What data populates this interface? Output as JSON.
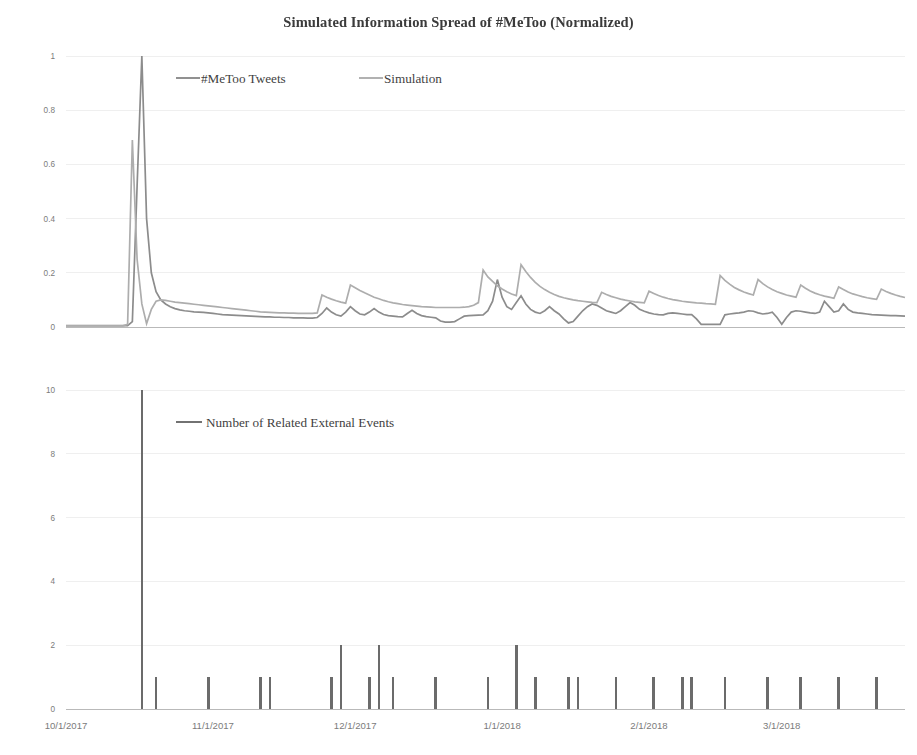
{
  "figure": {
    "title": "Simulated Information Spread of #MeToo (Normalized)",
    "ghost_header": "",
    "width": 917,
    "height": 755,
    "background": "#ffffff"
  },
  "colors": {
    "tweets": "#8c8c8c",
    "simulation": "#adadad",
    "events": "#6b6b6b",
    "grid": "#efefef",
    "axis": "#b9b9b9",
    "tick_text": "#7b7b7b",
    "title_text": "#3b3b3b",
    "legend_text": "#3f3f3f"
  },
  "chart_data": [
    {
      "type": "line",
      "title": "Simulated Information Spread of #MeToo (Normalized)",
      "panel": "top",
      "xlabel": "",
      "ylabel": "",
      "grid": true,
      "legend_position": "inside-top-left",
      "ylim": [
        0,
        1
      ],
      "yticks": [
        0,
        0.2,
        0.4,
        0.6,
        0.8,
        1
      ],
      "ytick_labels": [
        "0",
        "0.2",
        "0.4",
        "0.6",
        "0.8",
        "1"
      ],
      "xlim": [
        "10/1/2017",
        "3/26/2018"
      ],
      "xticks": [
        "10/1/2017",
        "11/1/2017",
        "12/1/2017",
        "1/1/2018",
        "2/1/2018",
        "3/1/2018"
      ],
      "x_total_days": 177,
      "x_tick_days": [
        0,
        31,
        61,
        92,
        123,
        151
      ],
      "legend": [
        {
          "name": "#MeToo Tweets",
          "color": "#8c8c8c"
        },
        {
          "name": "Simulation",
          "color": "#adadad"
        }
      ],
      "series": [
        {
          "name": "#MeToo Tweets",
          "color": "#8c8c8c",
          "x_days": [
            0,
            1,
            2,
            3,
            4,
            5,
            6,
            7,
            8,
            9,
            10,
            11,
            12,
            13,
            14,
            15,
            16,
            17,
            18,
            19,
            20,
            21,
            22,
            23,
            24,
            25,
            26,
            27,
            28,
            29,
            30,
            31,
            32,
            33,
            34,
            35,
            36,
            37,
            38,
            39,
            40,
            41,
            42,
            43,
            44,
            45,
            46,
            47,
            48,
            49,
            50,
            51,
            52,
            53,
            54,
            55,
            56,
            57,
            58,
            59,
            60,
            61,
            62,
            63,
            64,
            65,
            66,
            67,
            68,
            69,
            70,
            71,
            72,
            73,
            74,
            75,
            76,
            77,
            78,
            79,
            80,
            81,
            82,
            83,
            84,
            85,
            86,
            87,
            88,
            89,
            90,
            91,
            92,
            93,
            94,
            95,
            96,
            97,
            98,
            99,
            100,
            101,
            102,
            103,
            104,
            105,
            106,
            107,
            108,
            109,
            110,
            111,
            112,
            113,
            114,
            115,
            116,
            117,
            118,
            119,
            120,
            121,
            122,
            123,
            124,
            125,
            126,
            127,
            128,
            129,
            130,
            131,
            132,
            133,
            134,
            135,
            136,
            137,
            138,
            139,
            140,
            141,
            142,
            143,
            144,
            145,
            146,
            147,
            148,
            149,
            150,
            151,
            152,
            153,
            154,
            155,
            156,
            157,
            158,
            159,
            160,
            161,
            162,
            163,
            164,
            165,
            166,
            167,
            168,
            169,
            170,
            171,
            172,
            173,
            174,
            175,
            176,
            177
          ],
          "values": [
            0.005,
            0.005,
            0.005,
            0.005,
            0.005,
            0.005,
            0.005,
            0.005,
            0.005,
            0.005,
            0.005,
            0.005,
            0.005,
            0.005,
            0.02,
            0.52,
            1.0,
            0.4,
            0.2,
            0.13,
            0.1,
            0.085,
            0.075,
            0.068,
            0.063,
            0.06,
            0.058,
            0.056,
            0.055,
            0.054,
            0.052,
            0.05,
            0.048,
            0.046,
            0.045,
            0.044,
            0.043,
            0.042,
            0.041,
            0.04,
            0.039,
            0.038,
            0.037,
            0.037,
            0.036,
            0.036,
            0.035,
            0.035,
            0.034,
            0.034,
            0.034,
            0.033,
            0.033,
            0.035,
            0.05,
            0.07,
            0.055,
            0.045,
            0.04,
            0.055,
            0.075,
            0.06,
            0.048,
            0.045,
            0.055,
            0.068,
            0.055,
            0.046,
            0.042,
            0.04,
            0.038,
            0.037,
            0.05,
            0.062,
            0.05,
            0.042,
            0.038,
            0.036,
            0.034,
            0.022,
            0.018,
            0.018,
            0.02,
            0.03,
            0.04,
            0.042,
            0.043,
            0.044,
            0.045,
            0.06,
            0.095,
            0.175,
            0.11,
            0.075,
            0.065,
            0.09,
            0.115,
            0.085,
            0.065,
            0.055,
            0.05,
            0.06,
            0.075,
            0.06,
            0.048,
            0.03,
            0.015,
            0.02,
            0.04,
            0.06,
            0.075,
            0.085,
            0.08,
            0.07,
            0.06,
            0.055,
            0.05,
            0.06,
            0.075,
            0.09,
            0.08,
            0.065,
            0.058,
            0.052,
            0.048,
            0.046,
            0.045,
            0.05,
            0.052,
            0.05,
            0.048,
            0.046,
            0.046,
            0.03,
            0.01,
            0.01,
            0.01,
            0.01,
            0.01,
            0.045,
            0.048,
            0.05,
            0.052,
            0.055,
            0.06,
            0.058,
            0.052,
            0.048,
            0.05,
            0.055,
            0.035,
            0.01,
            0.035,
            0.055,
            0.06,
            0.058,
            0.055,
            0.052,
            0.05,
            0.055,
            0.095,
            0.075,
            0.055,
            0.06,
            0.085,
            0.065,
            0.055,
            0.052,
            0.05,
            0.048,
            0.046,
            0.045,
            0.044,
            0.043,
            0.042,
            0.042,
            0.041,
            0.04
          ]
        },
        {
          "name": "Simulation",
          "color": "#adadad",
          "x_days": [
            0,
            1,
            2,
            3,
            4,
            5,
            6,
            7,
            8,
            9,
            10,
            11,
            12,
            13,
            14,
            15,
            16,
            17,
            18,
            19,
            20,
            21,
            22,
            23,
            24,
            25,
            26,
            27,
            28,
            29,
            30,
            31,
            32,
            33,
            34,
            35,
            36,
            37,
            38,
            39,
            40,
            41,
            42,
            43,
            44,
            45,
            46,
            47,
            48,
            49,
            50,
            51,
            52,
            53,
            54,
            55,
            56,
            57,
            58,
            59,
            60,
            61,
            62,
            63,
            64,
            65,
            66,
            67,
            68,
            69,
            70,
            71,
            72,
            73,
            74,
            75,
            76,
            77,
            78,
            79,
            80,
            81,
            82,
            83,
            84,
            85,
            86,
            87,
            88,
            89,
            90,
            91,
            92,
            93,
            94,
            95,
            96,
            97,
            98,
            99,
            100,
            101,
            102,
            103,
            104,
            105,
            106,
            107,
            108,
            109,
            110,
            111,
            112,
            113,
            114,
            115,
            116,
            117,
            118,
            119,
            120,
            121,
            122,
            123,
            124,
            125,
            126,
            127,
            128,
            129,
            130,
            131,
            132,
            133,
            134,
            135,
            136,
            137,
            138,
            139,
            140,
            141,
            142,
            143,
            144,
            145,
            146,
            147,
            148,
            149,
            150,
            151,
            152,
            153,
            154,
            155,
            156,
            157,
            158,
            159,
            160,
            161,
            162,
            163,
            164,
            165,
            166,
            167,
            168,
            169,
            170,
            171,
            172,
            173,
            174,
            175,
            176,
            177
          ],
          "values": [
            0.004,
            0.004,
            0.004,
            0.004,
            0.004,
            0.004,
            0.004,
            0.004,
            0.004,
            0.004,
            0.004,
            0.004,
            0.004,
            0.01,
            0.69,
            0.25,
            0.085,
            0.012,
            0.065,
            0.095,
            0.1,
            0.098,
            0.095,
            0.092,
            0.09,
            0.088,
            0.086,
            0.084,
            0.082,
            0.08,
            0.078,
            0.076,
            0.074,
            0.072,
            0.07,
            0.068,
            0.066,
            0.064,
            0.062,
            0.06,
            0.058,
            0.056,
            0.055,
            0.054,
            0.053,
            0.052,
            0.052,
            0.051,
            0.051,
            0.05,
            0.05,
            0.05,
            0.05,
            0.052,
            0.118,
            0.11,
            0.103,
            0.097,
            0.092,
            0.088,
            0.155,
            0.145,
            0.135,
            0.126,
            0.118,
            0.11,
            0.104,
            0.098,
            0.093,
            0.089,
            0.086,
            0.083,
            0.081,
            0.079,
            0.077,
            0.075,
            0.074,
            0.073,
            0.072,
            0.072,
            0.072,
            0.072,
            0.072,
            0.072,
            0.073,
            0.075,
            0.08,
            0.09,
            0.21,
            0.185,
            0.168,
            0.152,
            0.14,
            0.13,
            0.122,
            0.116,
            0.23,
            0.205,
            0.183,
            0.165,
            0.15,
            0.138,
            0.128,
            0.12,
            0.113,
            0.108,
            0.104,
            0.1,
            0.097,
            0.095,
            0.093,
            0.091,
            0.09,
            0.128,
            0.12,
            0.113,
            0.108,
            0.103,
            0.099,
            0.096,
            0.093,
            0.091,
            0.089,
            0.132,
            0.124,
            0.116,
            0.11,
            0.105,
            0.101,
            0.098,
            0.095,
            0.093,
            0.091,
            0.089,
            0.088,
            0.086,
            0.085,
            0.084,
            0.19,
            0.172,
            0.158,
            0.146,
            0.137,
            0.129,
            0.123,
            0.118,
            0.175,
            0.16,
            0.148,
            0.138,
            0.13,
            0.124,
            0.118,
            0.114,
            0.11,
            0.155,
            0.143,
            0.133,
            0.125,
            0.119,
            0.114,
            0.11,
            0.106,
            0.148,
            0.138,
            0.129,
            0.122,
            0.117,
            0.112,
            0.108,
            0.105,
            0.102,
            0.14,
            0.131,
            0.124,
            0.118,
            0.113,
            0.109,
            0.105,
            0.085,
            0.08
          ]
        }
      ]
    },
    {
      "type": "bar",
      "panel": "bottom",
      "title": "",
      "xlabel": "",
      "ylabel": "",
      "grid": true,
      "legend_position": "inside-top-left",
      "ylim": [
        0,
        10
      ],
      "yticks": [
        0,
        2,
        4,
        6,
        8,
        10
      ],
      "ytick_labels": [
        "0",
        "2",
        "4",
        "6",
        "8",
        "10"
      ],
      "xlim": [
        "10/1/2017",
        "3/26/2018"
      ],
      "xticks": [
        "10/1/2017",
        "11/1/2017",
        "12/1/2017",
        "1/1/2018",
        "2/1/2018",
        "3/1/2018"
      ],
      "x_total_days": 177,
      "x_tick_days": [
        0,
        31,
        61,
        92,
        123,
        151
      ],
      "legend": [
        {
          "name": "Number of Related External Events",
          "color": "#6b6b6b"
        }
      ],
      "series": [
        {
          "name": "Number of Related External Events",
          "color": "#6b6b6b",
          "bars": [
            {
              "x_day": 16,
              "value": 10
            },
            {
              "x_day": 19,
              "value": 1
            },
            {
              "x_day": 30,
              "value": 1
            },
            {
              "x_day": 41,
              "value": 1
            },
            {
              "x_day": 43,
              "value": 1
            },
            {
              "x_day": 56,
              "value": 1
            },
            {
              "x_day": 58,
              "value": 2
            },
            {
              "x_day": 64,
              "value": 1
            },
            {
              "x_day": 66,
              "value": 2
            },
            {
              "x_day": 69,
              "value": 1
            },
            {
              "x_day": 78,
              "value": 1
            },
            {
              "x_day": 89,
              "value": 1
            },
            {
              "x_day": 95,
              "value": 2
            },
            {
              "x_day": 99,
              "value": 1
            },
            {
              "x_day": 106,
              "value": 1
            },
            {
              "x_day": 108,
              "value": 1
            },
            {
              "x_day": 116,
              "value": 1
            },
            {
              "x_day": 124,
              "value": 1
            },
            {
              "x_day": 130,
              "value": 1
            },
            {
              "x_day": 132,
              "value": 1
            },
            {
              "x_day": 139,
              "value": 1
            },
            {
              "x_day": 148,
              "value": 1
            },
            {
              "x_day": 155,
              "value": 1
            },
            {
              "x_day": 163,
              "value": 1
            },
            {
              "x_day": 171,
              "value": 1
            }
          ]
        }
      ]
    }
  ]
}
